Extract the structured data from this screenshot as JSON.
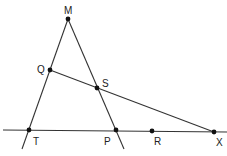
{
  "diagram": {
    "points": [
      {
        "name": "M",
        "x": 68,
        "y": 19,
        "lx": 64,
        "ly": 13
      },
      {
        "name": "Q",
        "x": 50,
        "y": 70,
        "lx": 38,
        "ly": 73
      },
      {
        "name": "S",
        "x": 97,
        "y": 88,
        "lx": 102,
        "ly": 86
      },
      {
        "name": "T",
        "x": 29,
        "y": 130,
        "lx": 34,
        "ly": 144
      },
      {
        "name": "P",
        "x": 116,
        "y": 130,
        "lx": 105,
        "ly": 144
      },
      {
        "name": "R",
        "x": 152,
        "y": 131,
        "lx": 154,
        "ly": 144
      },
      {
        "name": "X",
        "x": 214,
        "y": 132,
        "lx": 217,
        "ly": 145
      }
    ],
    "labels": {
      "M": "M",
      "Q": "Q",
      "S": "S",
      "T": "T",
      "P": "P",
      "R": "R",
      "X": "X"
    }
  }
}
